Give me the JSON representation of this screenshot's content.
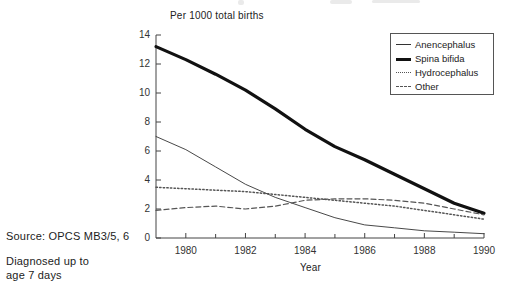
{
  "figure": {
    "y_axis_caption": "Per 1000 total births",
    "x_axis_title": "Year",
    "source_note": "Source: OPCS MB3/5, 6",
    "diagnosed_note": "Diagnosed up to\nage 7 days"
  },
  "legend": {
    "items": [
      {
        "label": "Anencephalus",
        "style": "thin-solid"
      },
      {
        "label": "Spina bifida",
        "style": "thick-solid"
      },
      {
        "label": "Hydrocephalus",
        "style": "dotted"
      },
      {
        "label": "Other",
        "style": "dashed"
      }
    ]
  },
  "chart_data": {
    "type": "line",
    "title": "",
    "xlabel": "Year",
    "ylabel": "Per 1000 total births",
    "xlim": [
      1979,
      1990
    ],
    "ylim": [
      0,
      14
    ],
    "yticks": [
      0,
      2,
      4,
      6,
      8,
      10,
      12,
      14
    ],
    "xticks": [
      1980,
      1982,
      1984,
      1986,
      1988,
      1990
    ],
    "xticks_minor": [
      1979,
      1981,
      1983,
      1985,
      1987,
      1989
    ],
    "grid": false,
    "legend_position": "top-right",
    "x": [
      1979,
      1980,
      1981,
      1982,
      1983,
      1984,
      1985,
      1986,
      1987,
      1988,
      1989,
      1990
    ],
    "series": [
      {
        "name": "Anencephalus",
        "style": "thin-solid",
        "values": [
          7.0,
          6.1,
          4.9,
          3.7,
          2.8,
          2.1,
          1.4,
          0.9,
          0.7,
          0.5,
          0.4,
          0.3
        ]
      },
      {
        "name": "Spina bifida",
        "style": "thick-solid",
        "values": [
          13.2,
          12.3,
          11.3,
          10.2,
          8.9,
          7.5,
          6.3,
          5.4,
          4.4,
          3.4,
          2.4,
          1.7
        ]
      },
      {
        "name": "Hydrocephalus",
        "style": "dotted",
        "values": [
          3.5,
          3.4,
          3.3,
          3.2,
          3.0,
          2.8,
          2.6,
          2.4,
          2.2,
          1.9,
          1.6,
          1.3
        ]
      },
      {
        "name": "Other",
        "style": "dashed",
        "values": [
          1.9,
          2.1,
          2.2,
          2.0,
          2.2,
          2.6,
          2.7,
          2.7,
          2.6,
          2.4,
          2.0,
          1.6
        ]
      }
    ]
  }
}
